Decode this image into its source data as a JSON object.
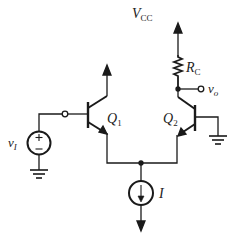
{
  "diagram": {
    "type": "circuit",
    "labels": {
      "vcc": {
        "main": "V",
        "sub": "CC"
      },
      "rc": {
        "main": "R",
        "sub": "C"
      },
      "vo": {
        "main": "v",
        "sub": "o"
      },
      "vi": {
        "main": "v",
        "sub": "I"
      },
      "q1": {
        "main": "Q",
        "sub": "1"
      },
      "q2": {
        "main": "Q",
        "sub": "2"
      },
      "i": {
        "main": "I"
      }
    },
    "components": [
      {
        "id": "Q1",
        "kind": "npn-transistor"
      },
      {
        "id": "Q2",
        "kind": "npn-transistor"
      },
      {
        "id": "RC",
        "kind": "resistor"
      },
      {
        "id": "vI",
        "kind": "voltage-source"
      },
      {
        "id": "I",
        "kind": "current-source"
      },
      {
        "id": "GND1",
        "kind": "ground"
      },
      {
        "id": "GND2",
        "kind": "ground"
      }
    ],
    "colors": {
      "stroke": "#1a1a1a",
      "background": "#ffffff"
    }
  }
}
